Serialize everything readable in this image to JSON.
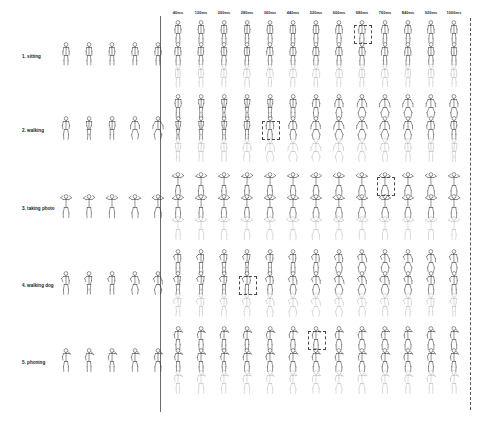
{
  "figure": {
    "name": "motion-prediction-grid",
    "background_color": "#ffffff",
    "ink_color": "#3b3b3b",
    "faint_ink_color": "#a8a8a8",
    "highlight_color": "#4a4a4a"
  },
  "time_axis": {
    "unit": "ms",
    "labels": [
      "40ms",
      "120ms",
      "200ms",
      "280ms",
      "360ms",
      "440ms",
      "520ms",
      "600ms",
      "680ms",
      "760ms",
      "840ms",
      "920ms",
      "1000ms"
    ],
    "values": [
      40,
      120,
      200,
      280,
      360,
      440,
      520,
      600,
      680,
      760,
      840,
      920,
      1000
    ],
    "step_ms": 80
  },
  "rows": [
    {
      "index": 1,
      "label": "1. sitting",
      "seed_frames": 5,
      "subrows": 3,
      "highlight_column": "680ms"
    },
    {
      "index": 2,
      "label": "2. walking",
      "seed_frames": 5,
      "subrows": 3,
      "highlight_column": "360ms"
    },
    {
      "index": 3,
      "label": "3. taking photo",
      "seed_frames": 5,
      "subrows": 3,
      "highlight_column": "760ms"
    },
    {
      "index": 4,
      "label": "4. walking dog",
      "seed_frames": 5,
      "subrows": 3,
      "highlight_column": "280ms"
    },
    {
      "index": 5,
      "label": "5. phoning",
      "seed_frames": 5,
      "subrows": 3,
      "highlight_column": "520ms"
    }
  ],
  "panels": {
    "seed_panel_name": "observed-seed-sequence",
    "prediction_panel_name": "predicted-sequence-grid"
  },
  "markers": {
    "separator_label": "seed-prediction-separator",
    "right_boundary_label": "horizon-boundary-dashed"
  }
}
